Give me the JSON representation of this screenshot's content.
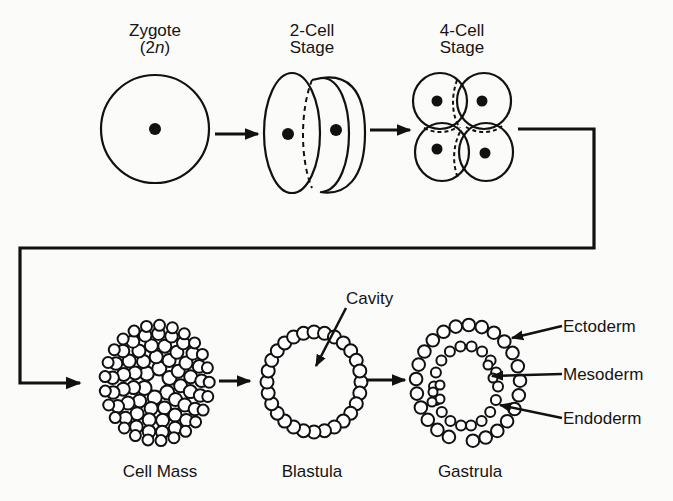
{
  "diagram": {
    "type": "process-flow",
    "stages": [
      {
        "id": "zygote",
        "label_line1": "Zygote",
        "label_line2": "(2",
        "label_italic": "n",
        "label_close": ")"
      },
      {
        "id": "two-cell",
        "label_line1": "2-Cell",
        "label_line2": "Stage"
      },
      {
        "id": "four-cell",
        "label_line1": "4-Cell",
        "label_line2": "Stage"
      },
      {
        "id": "cell-mass",
        "label": "Cell Mass"
      },
      {
        "id": "blastula",
        "label": "Blastula"
      },
      {
        "id": "gastrula",
        "label": "Gastrula"
      }
    ],
    "annotations": {
      "cavity": "Cavity",
      "ectoderm": "Ectoderm",
      "mesoderm": "Mesoderm",
      "endoderm": "Endoderm"
    },
    "flow": [
      "zygote",
      "two-cell",
      "four-cell",
      "cell-mass",
      "blastula",
      "gastrula"
    ],
    "colors": {
      "ink": "#111111",
      "paper": "#fbfbf9"
    }
  }
}
